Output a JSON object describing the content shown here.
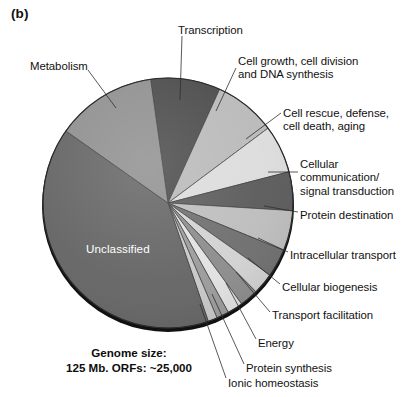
{
  "figure": {
    "panel_label": "(b)",
    "caption_line1": "Genome size:",
    "caption_line2": "125 Mb. ORFs: ~25,000",
    "inner_label": "Unclassified"
  },
  "chart_data": {
    "type": "pie",
    "title": "",
    "subtitle": "",
    "xlabel": "",
    "ylabel": "",
    "legend_position": "callout-labels",
    "grid": false,
    "units": "percent of ORFs",
    "start_angle_deg": -8,
    "direction": "clockwise",
    "center_px": [
      168,
      203
    ],
    "radius_px": 125,
    "categories": [
      "Transcription",
      "Cell growth, cell division\nand DNA synthesis",
      "Cell rescue, defense,\ncell death, aging",
      "Cellular\ncommunication/\nsignal transduction",
      "Protein destination",
      "Intracellular transport",
      "Cellular biogenesis",
      "Transport facilitation",
      "Energy",
      "Protein synthesis",
      "Ionic homeostasis",
      "Unclassified",
      "Metabolism"
    ],
    "values": [
      9.0,
      8.0,
      6.2,
      5.0,
      5.2,
      3.6,
      2.8,
      2.4,
      2.0,
      1.6,
      1.2,
      40.0,
      13.0
    ],
    "colors": [
      "#4a4a4a",
      "#b9b9b9",
      "#dcdcdc",
      "#5a5a5a",
      "#bdbdbd",
      "#6e6e6e",
      "#d2d2d2",
      "#8c8c8c",
      "#e2e2e2",
      "#9b9b9b",
      "#c8c8c8",
      "#646464",
      "#8f8f8f"
    ]
  },
  "labels": [
    {
      "name": "metabolism",
      "text": "Metabolism",
      "x": 30,
      "y": 60,
      "align": "l"
    },
    {
      "name": "transcription",
      "text": "Transcription",
      "x": 178,
      "y": 24,
      "align": "l"
    },
    {
      "name": "cell-growth",
      "text": "Cell growth, cell division\nand DNA synthesis",
      "x": 238,
      "y": 55,
      "align": "r"
    },
    {
      "name": "cell-rescue",
      "text": "Cell rescue, defense,\ncell death, aging",
      "x": 283,
      "y": 107,
      "align": "r"
    },
    {
      "name": "cellular-comm",
      "text": "Cellular\ncommunication/\nsignal transduction",
      "x": 300,
      "y": 158,
      "align": "r"
    },
    {
      "name": "protein-destination",
      "text": "Protein destination",
      "x": 300,
      "y": 209,
      "align": "r"
    },
    {
      "name": "intracellular-transport",
      "text": "Intracellular transport",
      "x": 290,
      "y": 249,
      "align": "r"
    },
    {
      "name": "cellular-biogenesis",
      "text": "Cellular biogenesis",
      "x": 282,
      "y": 281,
      "align": "r"
    },
    {
      "name": "transport-facilitation",
      "text": "Transport facilitation",
      "x": 272,
      "y": 309,
      "align": "r"
    },
    {
      "name": "energy",
      "text": "Energy",
      "x": 258,
      "y": 337,
      "align": "r"
    },
    {
      "name": "protein-synthesis",
      "text": "Protein synthesis",
      "x": 246,
      "y": 362,
      "align": "r"
    },
    {
      "name": "ionic-homeostasis",
      "text": "Ionic homeostasis",
      "x": 228,
      "y": 377,
      "align": "r"
    }
  ],
  "leaders": [
    {
      "name": "leader-metabolism",
      "x1": 88,
      "y1": 70,
      "x2": 116,
      "y2": 108
    },
    {
      "name": "leader-transcription",
      "x1": 182,
      "y1": 36,
      "x2": 180,
      "y2": 100
    },
    {
      "name": "leader-cell-growth",
      "x1": 236,
      "y1": 68,
      "x2": 216,
      "y2": 111
    },
    {
      "name": "leader-cell-rescue",
      "x1": 281,
      "y1": 113,
      "x2": 246,
      "y2": 139
    },
    {
      "name": "leader-cellular-comm",
      "x1": 298,
      "y1": 172,
      "x2": 268,
      "y2": 172
    },
    {
      "name": "leader-protein-destination",
      "x1": 298,
      "y1": 212,
      "x2": 264,
      "y2": 206
    },
    {
      "name": "leader-intracellular-transport",
      "x1": 288,
      "y1": 252,
      "x2": 258,
      "y2": 238
    },
    {
      "name": "leader-cellular-biogenesis",
      "x1": 280,
      "y1": 284,
      "x2": 248,
      "y2": 258
    },
    {
      "name": "leader-transport-facilitation",
      "x1": 270,
      "y1": 312,
      "x2": 236,
      "y2": 272
    },
    {
      "name": "leader-energy",
      "x1": 256,
      "y1": 339,
      "x2": 226,
      "y2": 283
    },
    {
      "name": "leader-protein-synthesis",
      "x1": 244,
      "y1": 364,
      "x2": 212,
      "y2": 294
    },
    {
      "name": "leader-ionic-homeostasis",
      "x1": 226,
      "y1": 378,
      "x2": 200,
      "y2": 304
    }
  ]
}
